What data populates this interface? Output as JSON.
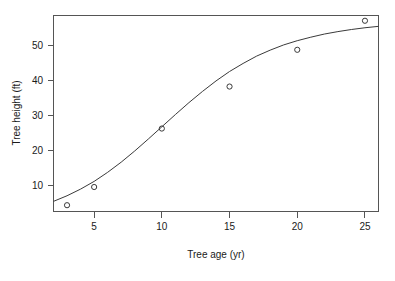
{
  "chart_data": {
    "type": "scatter",
    "title": "",
    "subtitle": "",
    "xlabel": "Tree age (yr)",
    "ylabel": "Tree height (ft)",
    "xlim": [
      2,
      26
    ],
    "ylim": [
      2.5,
      58.5
    ],
    "grid": false,
    "legend": null,
    "legend_position": "none",
    "x_ticks": [
      5,
      10,
      15,
      20,
      25
    ],
    "x_tick_labels": [
      "5",
      "10",
      "15",
      "20",
      "25"
    ],
    "y_ticks": [
      10,
      20,
      30,
      40,
      50
    ],
    "y_tick_labels": [
      "10",
      "20",
      "30",
      "40",
      "50"
    ],
    "x": [
      3,
      5,
      10,
      15,
      20,
      25
    ],
    "y": [
      4.3,
      9.5,
      26.2,
      38.2,
      48.7,
      57.0
    ],
    "series": [
      {
        "name": "Observed tree height",
        "marker": "open-circle",
        "x": [
          3,
          5,
          10,
          15,
          20,
          25
        ],
        "values": [
          4.3,
          9.5,
          26.2,
          38.2,
          48.7,
          57.0
        ]
      },
      {
        "name": "Fitted logistic growth curve",
        "marker": "line",
        "x": [
          2,
          3,
          4,
          5,
          6,
          7,
          8,
          9,
          10,
          11,
          12,
          13,
          14,
          15,
          16,
          17,
          18,
          19,
          20,
          21,
          22,
          23,
          24,
          25,
          26
        ],
        "values": [
          5.4,
          7.0,
          8.9,
          11.1,
          13.7,
          16.6,
          19.8,
          23.2,
          26.7,
          30.2,
          33.6,
          36.8,
          39.8,
          42.5,
          44.8,
          46.9,
          48.6,
          50.1,
          51.3,
          52.3,
          53.2,
          53.9,
          54.5,
          55.0,
          55.4
        ]
      }
    ]
  },
  "axes": {
    "x_title": "Tree age (yr)",
    "y_title": "Tree height (ft)"
  }
}
